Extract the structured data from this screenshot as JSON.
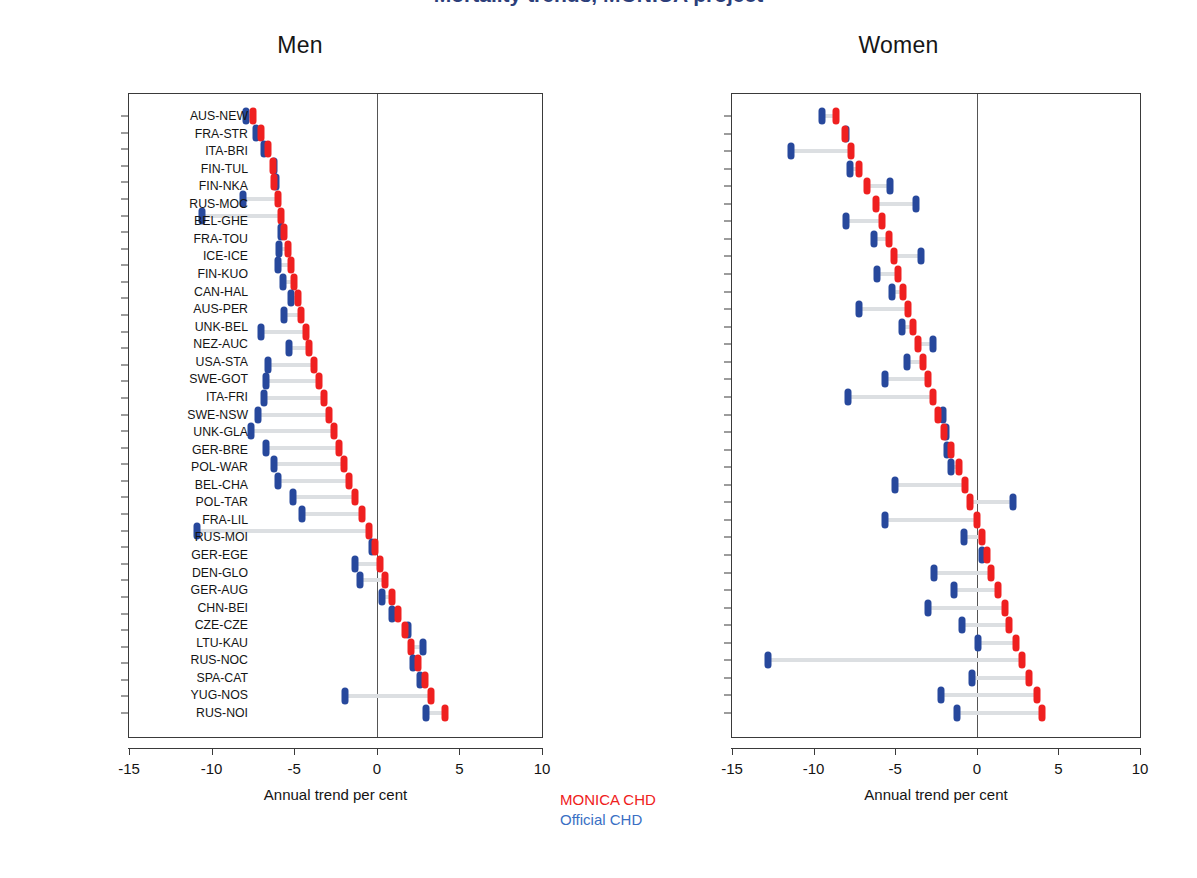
{
  "figure": {
    "cropped_title": "Mortality trends, MONICA project",
    "legend": {
      "monica": "MONICA CHD",
      "official": "Official CHD"
    },
    "colors": {
      "monica": "#EF2020",
      "official": "#27489C",
      "connector": "#DCDFE2",
      "axis": "#3A3A3A"
    }
  },
  "chart_data": {
    "type": "scatter",
    "xlabel": "Annual trend per cent",
    "ylabel": "",
    "xlim": [
      -15,
      10
    ],
    "xticks": [
      -15,
      -10,
      -5,
      0,
      5,
      10
    ],
    "xticklabels": [
      "-15",
      "-10",
      "-5",
      "0",
      "5",
      "10"
    ],
    "grid": false,
    "legend_position": "below-center",
    "series_names": [
      "MONICA CHD",
      "Official CHD"
    ],
    "panels": [
      {
        "name": "Men",
        "categories": [
          "SWE-NSW",
          "AUS-NEW",
          "FIN-NKA",
          "SWI-VAF",
          "ICE-ICE",
          "CAN-HAL",
          "FRA-TOU",
          "UNK-BEL",
          "SWI-TIC",
          "FRA-STR",
          "USA-STA",
          "NEZ-AUC",
          "FIN-KUO",
          "BEL-GHE",
          "FIN-TUL",
          "AUS-PER",
          "GER-BRE",
          "SWE-GOT",
          "ITA-BRI",
          "ITA-FRI",
          "DEN-GLO",
          "UNK-GLA",
          "GER-AUG",
          "FRA-LIL",
          "BEL-CHA",
          "YUG-NOS",
          "RUS-NOC",
          "SPA-CAT",
          "CZE-CZE",
          "POL-WAR",
          "GER-EGE",
          "LTU-KAU",
          "RUS-MOC",
          "POL-TAR",
          "RUS-MOI",
          "CHN-BEI",
          "RUS-NOI"
        ],
        "series": [
          {
            "name": "MONICA CHD",
            "values": [
              -7.5,
              -7.0,
              -6.6,
              -6.3,
              -6.2,
              -6.0,
              -5.8,
              -5.6,
              -5.4,
              -5.2,
              -5.0,
              -4.8,
              -4.6,
              -4.3,
              -4.1,
              -3.8,
              -3.5,
              -3.2,
              -2.9,
              -2.6,
              -2.3,
              -2.0,
              -1.7,
              -1.3,
              -0.9,
              -0.5,
              -0.1,
              0.2,
              0.5,
              0.9,
              1.3,
              1.7,
              2.1,
              2.5,
              2.9,
              3.3,
              4.1
            ]
          },
          {
            "name": "Official CHD",
            "values": [
              -7.9,
              -7.3,
              -6.8,
              -6.2,
              -6.1,
              -8.1,
              -10.6,
              -5.8,
              -5.9,
              -6.0,
              -5.7,
              -5.2,
              -5.6,
              -7.0,
              -5.3,
              -6.6,
              -6.7,
              -6.8,
              -7.2,
              -7.6,
              -6.7,
              -6.2,
              -6.0,
              -5.1,
              -4.5,
              -10.9,
              -0.3,
              -1.3,
              -1.0,
              0.3,
              0.9,
              1.9,
              2.8,
              2.2,
              2.6,
              -1.9,
              3.0
            ]
          }
        ]
      },
      {
        "name": "Women",
        "categories": [
          "AUS-NEW",
          "FRA-STR",
          "ITA-BRI",
          "FIN-TUL",
          "FIN-NKA",
          "RUS-MOC",
          "BEL-GHE",
          "FRA-TOU",
          "ICE-ICE",
          "FIN-KUO",
          "CAN-HAL",
          "AUS-PER",
          "UNK-BEL",
          "NEZ-AUC",
          "USA-STA",
          "SWE-GOT",
          "ITA-FRI",
          "SWE-NSW",
          "UNK-GLA",
          "GER-BRE",
          "POL-WAR",
          "BEL-CHA",
          "POL-TAR",
          "FRA-LIL",
          "RUS-MOI",
          "GER-EGE",
          "DEN-GLO",
          "GER-AUG",
          "CHN-BEI",
          "CZE-CZE",
          "LTU-KAU",
          "RUS-NOC",
          "SPA-CAT",
          "YUG-NOS",
          "RUS-NOI"
        ],
        "series": [
          {
            "name": "MONICA CHD",
            "values": [
              -8.6,
              -8.1,
              -7.7,
              -7.2,
              -6.7,
              -6.2,
              -5.8,
              -5.4,
              -5.1,
              -4.8,
              -4.5,
              -4.2,
              -3.9,
              -3.6,
              -3.3,
              -3.0,
              -2.7,
              -2.4,
              -2.0,
              -1.6,
              -1.1,
              -0.7,
              -0.4,
              0.0,
              0.3,
              0.6,
              0.9,
              1.3,
              1.7,
              2.0,
              2.4,
              2.8,
              3.2,
              3.7,
              4.0
            ]
          },
          {
            "name": "Official CHD",
            "values": [
              -9.5,
              -8.0,
              -11.4,
              -7.8,
              -5.3,
              -3.7,
              -8.0,
              -6.3,
              -3.4,
              -6.1,
              -5.2,
              -7.2,
              -4.6,
              -2.7,
              -4.3,
              -5.6,
              -7.9,
              -2.1,
              -1.9,
              -1.8,
              -1.6,
              -5.0,
              2.2,
              -5.6,
              -0.8,
              0.3,
              -2.6,
              -1.4,
              -3.0,
              -0.9,
              0.1,
              -12.8,
              -0.3,
              -2.2,
              -1.2
            ]
          }
        ]
      }
    ]
  }
}
